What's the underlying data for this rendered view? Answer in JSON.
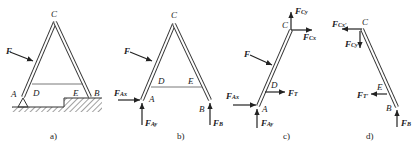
{
  "figures": [
    {
      "caption": "a)",
      "labels": {
        "A": "A",
        "B": "B",
        "C": "C",
        "D": "D",
        "E": "E",
        "F": "F"
      }
    },
    {
      "caption": "b)",
      "labels": {
        "A": "A",
        "B": "B",
        "C": "C",
        "D": "D",
        "E": "E",
        "F": "F",
        "FAx": "Ax",
        "FAy": "Ay",
        "FB": "B"
      }
    },
    {
      "caption": "c)",
      "labels": {
        "A": "A",
        "C": "C",
        "D": "D",
        "F": "F",
        "FAx": "Ax",
        "FAy": "Ay",
        "FCx": "Cx",
        "FCy": "Cy",
        "FT": "T"
      }
    },
    {
      "caption": "d)",
      "labels": {
        "B": "B",
        "C": "C",
        "E": "E",
        "FCx": "Cx′",
        "FCy": "Cy′",
        "FT": "T′",
        "FB": "B"
      }
    }
  ],
  "force_symbol": "F"
}
